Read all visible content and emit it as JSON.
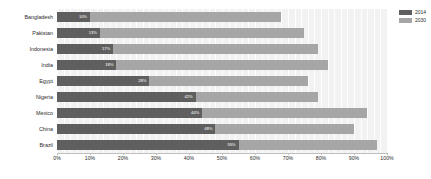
{
  "legend": {
    "position": "top-right",
    "items": [
      {
        "label": "2014",
        "color": "#5f5f5f",
        "name": "legend-2014"
      },
      {
        "label": "2030",
        "color": "#a6a6a6",
        "name": "legend-2030"
      }
    ]
  },
  "axis": {
    "x_ticks": [
      "0%",
      "10%",
      "20%",
      "30%",
      "40%",
      "50%",
      "60%",
      "70%",
      "80%",
      "90%",
      "100%"
    ]
  },
  "chart_data": {
    "type": "bar",
    "orientation": "horizontal",
    "stacked": true,
    "title": "",
    "xlabel": "",
    "ylabel": "",
    "xlim": [
      0,
      100
    ],
    "grid": true,
    "legend_position": "top-right",
    "categories": [
      "Bangladesh",
      "Pakistan",
      "Indonesia",
      "India",
      "Egypt",
      "Nigeria",
      "Mexico",
      "China",
      "Brazil"
    ],
    "series": [
      {
        "name": "2014",
        "color": "#5f5f5f",
        "values": [
          10,
          13,
          17,
          18,
          28,
          42,
          44,
          48,
          55
        ],
        "labels": [
          "10%",
          "13%",
          "17%",
          "18%",
          "28%",
          "42%",
          "44%",
          "48%",
          "55%"
        ]
      },
      {
        "name": "2030",
        "color": "#a6a6a6",
        "values": [
          58,
          62,
          62,
          64,
          48,
          37,
          50,
          42,
          42
        ],
        "labels": [
          "",
          "",
          "",
          "",
          "",
          "",
          "",
          "",
          ""
        ]
      }
    ],
    "totals": [
      68,
      75,
      79,
      82,
      76,
      79,
      94,
      90,
      97
    ]
  }
}
